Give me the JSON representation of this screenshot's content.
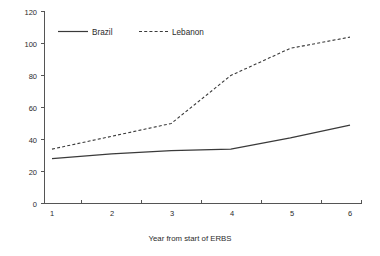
{
  "chart_data": {
    "type": "line",
    "title": "",
    "subtitle": "",
    "xlabel": "Year from start of ERBS",
    "ylabel": "",
    "x": [
      1,
      2,
      3,
      4,
      5,
      6
    ],
    "xtick_labels": [
      "1",
      "2",
      "3",
      "4",
      "5",
      "6"
    ],
    "ytick_labels": [
      "0",
      "20",
      "40",
      "60",
      "80",
      "100",
      "120"
    ],
    "ytick_values": [
      0,
      20,
      40,
      60,
      80,
      100,
      120
    ],
    "xlim": [
      0.6,
      6.4
    ],
    "ylim": [
      0,
      120
    ],
    "grid": false,
    "legend_position": "top-center",
    "series": [
      {
        "name": "Brazil",
        "style": "solid",
        "color": "#3a3a3a",
        "values": [
          28,
          31,
          33,
          34,
          41,
          49
        ]
      },
      {
        "name": "Lebanon",
        "style": "dashed",
        "color": "#3a3a3a",
        "values": [
          34,
          42,
          50,
          80,
          97,
          104
        ]
      }
    ]
  },
  "legend": {
    "entries": [
      {
        "label": "Brazil"
      },
      {
        "label": "Lebanon"
      }
    ]
  },
  "axes": {
    "x_title": "Year from start of ERBS"
  }
}
